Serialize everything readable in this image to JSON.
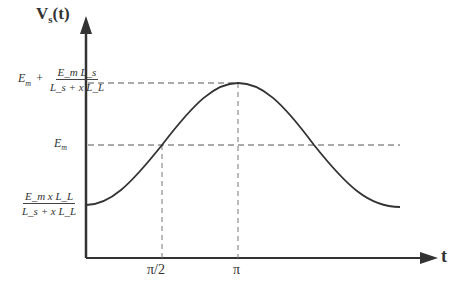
{
  "diagram": {
    "y_axis_label": "V",
    "y_axis_label_sub": "s",
    "y_axis_label_arg": "(t)",
    "x_axis_label": "t",
    "x_ticks": [
      "π/2",
      "π"
    ],
    "y_levels": {
      "top": {
        "prefix": "E",
        "prefix_sub": "m",
        "plus": "+",
        "numerator": "E_m L_s",
        "denominator": "L_s + x L_L"
      },
      "mid": {
        "text": "E",
        "sub": "m"
      },
      "low": {
        "numerator": "E_m x L_L",
        "denominator": "L_s + x L_L"
      }
    },
    "curve": "cosine-shaped voltage rising from low level at t=0 to peak at t=π then falling back",
    "colors": {
      "stroke": "#333333",
      "dash": "#555555",
      "background": "#ffffff"
    }
  }
}
